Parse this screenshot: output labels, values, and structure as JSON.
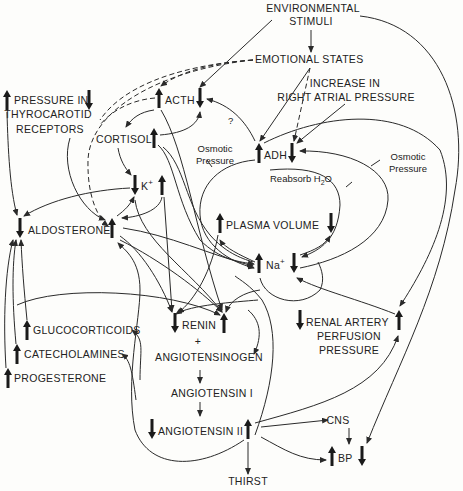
{
  "diagram": {
    "type": "flowchart",
    "nodes": {
      "environmental_stimuli": {
        "line1": "ENVIRONMENTAL",
        "line2": "STIMULI"
      },
      "emotional_states": {
        "label": "EMOTIONAL STATES"
      },
      "increase_right_atrial": {
        "line1": "INCREASE IN",
        "line2": "RIGHT ATRIAL PRESSURE"
      },
      "pressure_thyrocarotid": {
        "line1": "PRESSURE IN",
        "line2": "THYROCAROTID",
        "line3": "RECEPTORS"
      },
      "acth": {
        "label": "ACTH"
      },
      "cortisol": {
        "label": "CORTISOL"
      },
      "adh": {
        "label": "ADH"
      },
      "potassium": {
        "label": "K",
        "sup": "+"
      },
      "aldosterone": {
        "label": "ALDOSTERONE"
      },
      "plasma_volume": {
        "label": "PLASMA VOLUME"
      },
      "sodium": {
        "label": "Na",
        "sup": "+"
      },
      "renin": {
        "label": "RENIN"
      },
      "plus": {
        "label": "+"
      },
      "angiotensinogen": {
        "label": "ANGIOTENSINOGEN"
      },
      "angiotensin_1": {
        "label": "ANGIOTENSIN I"
      },
      "angiotensin_2": {
        "label": "ANGIOTENSIN II"
      },
      "renal_artery": {
        "line1": "RENAL ARTERY",
        "line2": "PERFUSION",
        "line3": "PRESSURE"
      },
      "glucocorticoids": {
        "label": "GLUCOCORTICOIDS"
      },
      "catecholamines": {
        "label": "CATECHOLAMINES"
      },
      "progesterone": {
        "label": "PROGESTERONE"
      },
      "cns": {
        "label": "CNS"
      },
      "bp": {
        "label": "BP"
      },
      "thirst": {
        "label": "THIRST"
      }
    },
    "annotations": {
      "osmotic_left": {
        "line1": "Osmotic",
        "line2": "Pressure"
      },
      "osmotic_right": {
        "line1": "Osmotic",
        "line2": "Pressure"
      },
      "reabsorb": {
        "text": "Reabsorb H",
        "sub": "2",
        "tail": "O"
      },
      "question": {
        "text": "?"
      }
    }
  }
}
